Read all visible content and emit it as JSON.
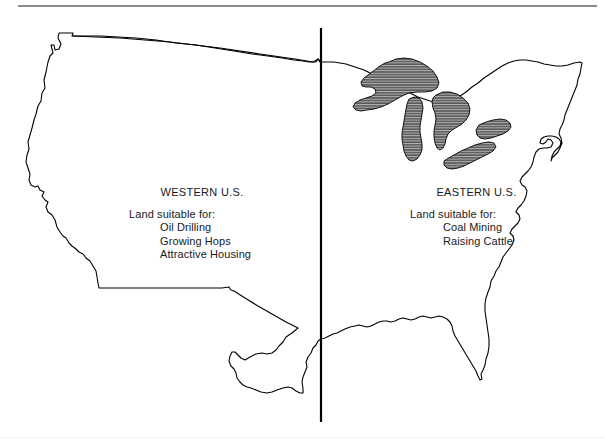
{
  "figure": {
    "divider_label": "vertical-division-line",
    "background_color": "#ffffff",
    "outline_color": "#000000",
    "lake_fill_color": "#595959",
    "lake_hatch_color": "#bdbdbd",
    "rule_color": "#8a8a8a"
  },
  "west": {
    "title": "WESTERN U.S.",
    "lead": "Land suitable for:",
    "items": [
      "Oil Drilling",
      "Growing Hops",
      "Attractive Housing"
    ]
  },
  "east": {
    "title": "EASTERN U.S.",
    "lead": "Land suitable for:",
    "items": [
      "Coal Mining",
      "Raising Cattle"
    ]
  },
  "lakes": [
    "Lake Superior",
    "Lake Michigan",
    "Lake Huron",
    "Lake Erie",
    "Lake Ontario"
  ]
}
